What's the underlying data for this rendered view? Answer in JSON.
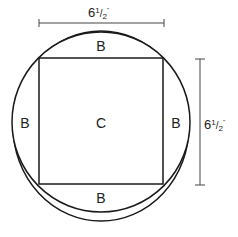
{
  "diagram": {
    "top_dimension": {
      "whole": "6",
      "frac_num": "1",
      "frac_den": "2",
      "mark": "\""
    },
    "right_dimension": {
      "whole": "6",
      "frac_num": "1",
      "frac_den": "2",
      "mark": "\""
    },
    "labels": {
      "top": "B",
      "left": "B",
      "right": "B",
      "bottom": "B",
      "center": "C"
    },
    "colors": {
      "line": "#1a1a1a",
      "dimension": "#444444"
    }
  }
}
